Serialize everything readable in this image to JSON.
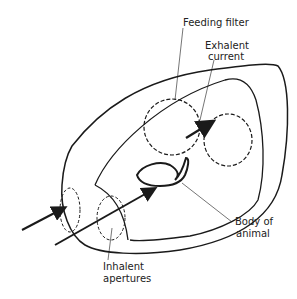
{
  "diagram": {
    "labels": {
      "feeding_filter": "Feeding filter",
      "exhalent_line1": "Exhalent",
      "exhalent_line2": "current",
      "body_line1": "Body of",
      "body_line2": "animal",
      "inhalent_line1": "Inhalent",
      "inhalent_line2": "apertures"
    },
    "colors": {
      "line": "#1a1a1a",
      "background": "#ffffff"
    }
  }
}
